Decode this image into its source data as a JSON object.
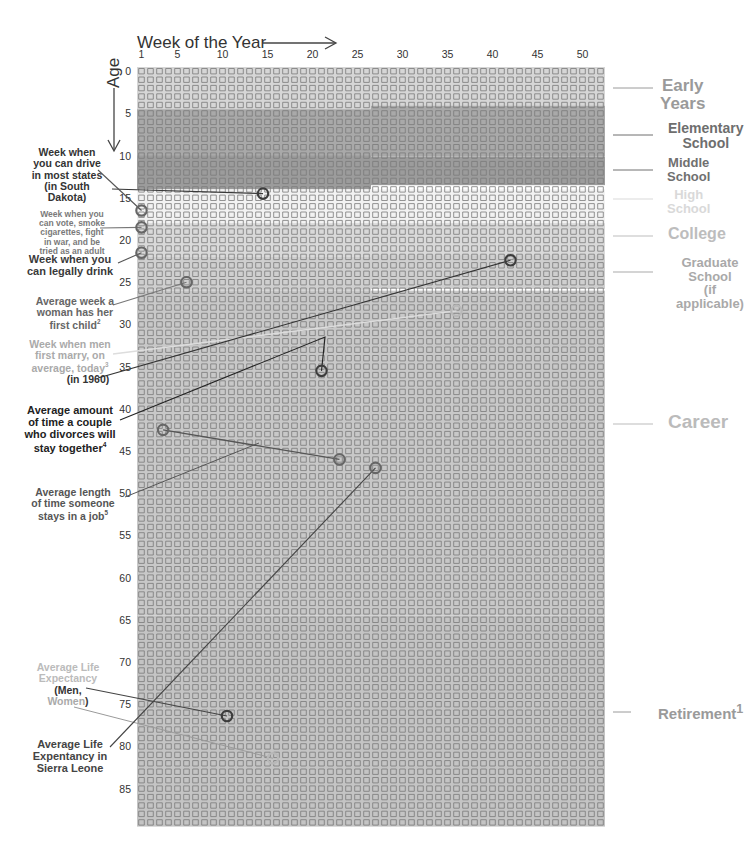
{
  "header": {
    "x_title": "Week of the Year",
    "y_title": "Age"
  },
  "axis": {
    "x_ticks": [
      "1",
      "5",
      "10",
      "15",
      "20",
      "25",
      "30",
      "35",
      "40",
      "45",
      "50"
    ],
    "x_tick_weeks": [
      1,
      5,
      10,
      15,
      20,
      25,
      30,
      35,
      40,
      45,
      50
    ],
    "y_ticks": [
      "0",
      "5",
      "10",
      "15",
      "20",
      "25",
      "30",
      "35",
      "40",
      "45",
      "50",
      "55",
      "60",
      "65",
      "70",
      "75",
      "80",
      "85"
    ],
    "y_tick_ages": [
      0,
      5,
      10,
      15,
      20,
      25,
      30,
      35,
      40,
      45,
      50,
      55,
      60,
      65,
      70,
      75,
      80,
      85
    ]
  },
  "grid": {
    "weeks": 52,
    "years": 90,
    "left": 137,
    "top": 67,
    "cell_w": 9.0,
    "cell_h": 8.44
  },
  "colors": {
    "box_stroke": "#7a7a7a",
    "early": "#d6d6d6",
    "elementary": "#a9a9a9",
    "middle": "#9c9c9c",
    "high": "#f2f2f2",
    "college": "#d9d9d9",
    "graduate": "#cfcfcf",
    "career": "#c8c8c8",
    "retirement": "#c4c4c4",
    "marker_dark": "#3c3c3c",
    "marker_mid": "#666666",
    "marker_light": "#b8b8b8"
  },
  "stages": [
    {
      "id": "early",
      "label": "Early Years",
      "lines": [
        "Early",
        "Years"
      ],
      "color": "#9a9a9a",
      "size": 17,
      "x": 672,
      "y": 77,
      "tick_y": 88
    },
    {
      "id": "elementary",
      "label": "Elementary School",
      "lines": [
        "Elementary",
        "School"
      ],
      "color": "#6e6e6e",
      "size": 14,
      "x": 680,
      "y": 121,
      "tick_y": 135
    },
    {
      "id": "middle",
      "label": "Middle School",
      "lines": [
        "Middle",
        "School"
      ],
      "color": "#707070",
      "size": 13,
      "x": 679,
      "y": 156,
      "tick_y": 170
    },
    {
      "id": "high",
      "label": "High School",
      "lines": [
        "High",
        "School"
      ],
      "color": "#d9d9d9",
      "size": 13,
      "x": 679,
      "y": 188,
      "tick_y": 199
    },
    {
      "id": "college",
      "label": "College",
      "lines": [
        "College"
      ],
      "color": "#bdbdbd",
      "size": 16,
      "x": 680,
      "y": 226,
      "tick_y": 236
    },
    {
      "id": "graduate",
      "label": "Graduate School (if applicable)",
      "lines": [
        "Graduate",
        "School",
        "(if applicable)"
      ],
      "color": "#a9a9a9",
      "size": 13,
      "x": 682,
      "y": 256,
      "tick_y": 272
    },
    {
      "id": "career",
      "label": "Career",
      "lines": [
        "Career"
      ],
      "color": "#bbbbbb",
      "size": 19,
      "x": 680,
      "y": 412,
      "tick_y": 424
    },
    {
      "id": "retirement",
      "label": "Retirement",
      "sup": "1",
      "lines": [
        "Retirement"
      ],
      "color": "#9a9a9a",
      "size": 15,
      "x": 674,
      "y": 703,
      "tick_y": 712
    }
  ],
  "bands": [
    {
      "stage": "early",
      "segments": [
        [
          0,
          0,
          52,
          5
        ]
      ]
    },
    {
      "stage": "elementary",
      "segments": [
        [
          0,
          5,
          26,
          6
        ],
        [
          26,
          4.6,
          26,
          6
        ]
      ]
    },
    {
      "stage": "middle",
      "segments": [
        [
          0,
          10.5,
          26,
          4
        ],
        [
          26,
          10.6,
          26,
          3.4
        ]
      ]
    },
    {
      "stage": "high",
      "segments": [
        [
          0,
          14.5,
          52,
          4
        ]
      ]
    },
    {
      "stage": "college",
      "segments": [
        [
          0,
          18.5,
          52,
          4
        ]
      ]
    },
    {
      "stage": "graduate",
      "segments": [
        [
          0,
          22.5,
          26,
          4
        ],
        [
          26,
          22.3,
          26,
          4
        ]
      ]
    },
    {
      "stage": "career",
      "segments": [
        [
          0,
          26.5,
          52,
          38.5
        ]
      ]
    },
    {
      "stage": "retirement",
      "segments": [
        [
          0,
          65,
          52,
          25
        ]
      ]
    }
  ],
  "annotations": [
    {
      "id": "drive",
      "text": [
        "Week when",
        "you can drive",
        "in most states",
        "(in South",
        "Dakota)"
      ],
      "color": "#333333",
      "size": 10.5,
      "x": 57,
      "y": 147,
      "marker": {
        "week": 14.5,
        "age": 14.5,
        "style": "dark"
      },
      "line_from": [
        112,
        189
      ],
      "line_color": "#3a3a3a"
    },
    {
      "id": "vote",
      "text": [
        "Week when you",
        "can vote, smoke",
        "cigarettes, fight",
        "in war, and be",
        "tried as an adult"
      ],
      "color": "#7a7a7a",
      "size": 8.5,
      "x": 62,
      "y": 210,
      "marker": {
        "week": 1,
        "age": 18.5,
        "style": "mid"
      },
      "line_from": [
        100,
        228
      ],
      "line_color": "#777777"
    },
    {
      "id": "drink-16",
      "text": [],
      "marker": {
        "week": 1,
        "age": 16.5,
        "style": "mid"
      },
      "line_from": [
        98,
        170
      ],
      "line_color": "#555555"
    },
    {
      "id": "drink",
      "text": [
        "Week when you",
        "can legally drink"
      ],
      "color": "#3a3a3a",
      "size": 11,
      "x": 60,
      "y": 254,
      "marker": {
        "week": 1,
        "age": 21.5,
        "style": "mid"
      },
      "line_from": [
        118,
        263
      ],
      "line_color": "#555555"
    },
    {
      "id": "first-child",
      "text": [
        "Average week a",
        "woman has her",
        "first child"
      ],
      "sup": "2",
      "color": "#666666",
      "size": 10.5,
      "x": 65,
      "y": 296,
      "marker": {
        "week": 6,
        "age": 25,
        "style": "mid"
      },
      "line_from": [
        113,
        305
      ],
      "line_color": "#777777"
    },
    {
      "id": "marry-today",
      "text": [
        "Week when men",
        "first marry, on",
        "average, today"
      ],
      "sup": "3",
      "color": "#aaaaaa",
      "size": 10.5,
      "x": 60,
      "y": 339,
      "marker": {
        "week": 36,
        "age": 28.4,
        "style": "light"
      },
      "line_from": [
        113,
        354
      ],
      "line_color": "#dddddd"
    },
    {
      "id": "marry-1960",
      "text": [
        "(in 1960)"
      ],
      "color": "#333333",
      "size": 10.5,
      "x": 78,
      "y": 374,
      "marker": {
        "week": 42,
        "age": 22.4,
        "style": "dark"
      },
      "line_from": [
        98,
        378
      ],
      "line_color": "#333333"
    },
    {
      "id": "divorce",
      "text": [
        "Average amount",
        "of time a couple",
        "who divorces will",
        "stay together"
      ],
      "sup": "4",
      "color": "#222222",
      "size": 11,
      "x": 60,
      "y": 405,
      "marker": {
        "week": 21,
        "age": 35.5,
        "style": "dark"
      },
      "line_from": [
        120,
        420
      ],
      "line_via": [
        [
          325,
          337
        ]
      ],
      "line_color": "#222222"
    },
    {
      "id": "job",
      "text": [
        "Average length",
        "of time someone",
        "stays in a job"
      ],
      "sup": "5",
      "color": "#555555",
      "size": 10.5,
      "x": 63,
      "y": 487,
      "marker": {
        "week": 23,
        "age": 46,
        "style": "mid"
      },
      "marker2": {
        "week": 3.4,
        "age": 42.5,
        "style": "mid"
      },
      "line_from": [
        125,
        497
      ],
      "line_via": [
        [
          259,
          443
        ]
      ],
      "line_color": "#555555"
    },
    {
      "id": "life-exp",
      "text": [
        "Average Life",
        "Expectancy"
      ],
      "color": "#bbbbbb",
      "size": 10.5,
      "x": 58,
      "y": 662,
      "sub": [
        "(Men,",
        "Women)"
      ],
      "sub_color": "#333333",
      "marker": {
        "week": 10.5,
        "age": 76.4,
        "style": "dark"
      },
      "line_from": [
        86,
        688
      ],
      "line_color": "#444444",
      "marker_women": {
        "week": 15.6,
        "age": 81.4,
        "style": "light"
      },
      "line_from_women": [
        74,
        707
      ],
      "line_color_women": "#9a9a9a"
    },
    {
      "id": "sierra-leone",
      "text": [
        "Average Life",
        "Expentancy in",
        "Sierra Leone"
      ],
      "color": "#444444",
      "size": 11,
      "x": 60,
      "y": 739,
      "marker": {
        "week": 27,
        "age": 47,
        "style": "mid"
      },
      "line_from": [
        110,
        747
      ],
      "line_color": "#444444"
    }
  ],
  "chart_data": {
    "type": "heatmap",
    "xlabel": "Week of the Year",
    "ylabel": "Age",
    "x_range": [
      1,
      52
    ],
    "y_range": [
      0,
      89
    ],
    "grid": true,
    "legend_position": "right",
    "stages": [
      {
        "label": "Early Years",
        "age_range": [
          0,
          5
        ]
      },
      {
        "label": "Elementary School",
        "age_range": [
          5,
          10.5
        ]
      },
      {
        "label": "Middle School",
        "age_range": [
          10.5,
          14.5
        ]
      },
      {
        "label": "High School",
        "age_range": [
          14.5,
          18.5
        ]
      },
      {
        "label": "College",
        "age_range": [
          18.5,
          22.5
        ]
      },
      {
        "label": "Graduate School (if applicable)",
        "age_range": [
          22.5,
          26.5
        ]
      },
      {
        "label": "Career",
        "age_range": [
          26.5,
          65
        ]
      },
      {
        "label": "Retirement",
        "age_range": [
          65,
          90
        ]
      }
    ],
    "points": [
      {
        "label": "Week when you can drive in most states (in South Dakota)",
        "week": 14,
        "age": 14
      },
      {
        "label": "(drive in most states)",
        "week": 1,
        "age": 16
      },
      {
        "label": "Week when you can vote, smoke cigarettes, fight in war, and be tried as an adult",
        "week": 1,
        "age": 18
      },
      {
        "label": "Week when you can legally drink",
        "week": 1,
        "age": 21
      },
      {
        "label": "Average week a woman has her first child",
        "week": 6,
        "age": 25
      },
      {
        "label": "Week when men first marry, on average, today",
        "week": 36,
        "age": 28
      },
      {
        "label": "Week when men first marry (in 1960)",
        "week": 41,
        "age": 22
      },
      {
        "label": "Average amount of time a couple who divorces will stay together",
        "week": 21,
        "age": 35
      },
      {
        "label": "Average length of time someone stays in a job (start)",
        "week": 3,
        "age": 42
      },
      {
        "label": "Average length of time someone stays in a job (end)",
        "week": 23,
        "age": 46
      },
      {
        "label": "Average Life Expectancy in Sierra Leone",
        "week": 27,
        "age": 47
      },
      {
        "label": "Average Life Expectancy (Men)",
        "week": 10,
        "age": 76
      },
      {
        "label": "Average Life Expectancy (Women)",
        "week": 15,
        "age": 81
      }
    ]
  }
}
